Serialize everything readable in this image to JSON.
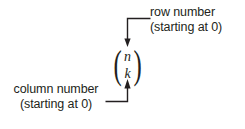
{
  "diagram": {
    "ink_color": "#231f20",
    "background_color": "#ffffff",
    "formula": {
      "name": "binomial-coefficient",
      "top_symbol": "n",
      "bottom_symbol": "k",
      "left_paren": "(",
      "right_paren": ")"
    },
    "annotations": [
      {
        "id": "row-number",
        "line1": "row number",
        "line2": "(starting at 0)",
        "points_to": "n",
        "arrow_direction": "down"
      },
      {
        "id": "column-number",
        "line1": "column number",
        "line2": "(starting at 0)",
        "points_to": "k",
        "arrow_direction": "up"
      }
    ]
  }
}
